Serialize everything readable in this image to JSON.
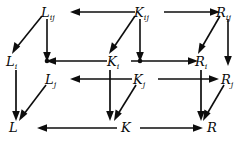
{
  "diagram": {
    "type": "commutative-diagram",
    "width": 248,
    "height": 143,
    "background_color": "#ffffff",
    "ink_color": "#0d0d0d",
    "nodes": [
      {
        "id": "Lij",
        "base": "L",
        "sub": "ij",
        "x": 47,
        "y": 14,
        "row": "top",
        "column": "L"
      },
      {
        "id": "Kij",
        "base": "K",
        "sub": "ij",
        "x": 140,
        "y": 14,
        "row": "top",
        "column": "K"
      },
      {
        "id": "Rij",
        "base": "R",
        "sub": "ij",
        "x": 222,
        "y": 14,
        "row": "top",
        "column": "R"
      },
      {
        "id": "Li",
        "base": "L",
        "sub": "i",
        "x": 11,
        "y": 63,
        "row": "middle",
        "column": "L"
      },
      {
        "id": "Ki",
        "base": "K",
        "sub": "i",
        "x": 113,
        "y": 63,
        "row": "middle",
        "column": "K"
      },
      {
        "id": "Ri",
        "base": "R",
        "sub": "i",
        "x": 200,
        "y": 63,
        "row": "middle",
        "column": "R"
      },
      {
        "id": "Lj",
        "base": "L",
        "sub": "j",
        "x": 50,
        "y": 81,
        "row": "inner",
        "column": "L"
      },
      {
        "id": "Kj",
        "base": "K",
        "sub": "j",
        "x": 139,
        "y": 81,
        "row": "inner",
        "column": "K"
      },
      {
        "id": "Rj",
        "base": "R",
        "sub": "j",
        "x": 226,
        "y": 81,
        "row": "inner",
        "column": "R"
      },
      {
        "id": "L",
        "base": "L",
        "sub": "",
        "x": 14,
        "y": 129,
        "row": "bottom",
        "column": "L"
      },
      {
        "id": "K",
        "base": "K",
        "sub": "",
        "x": 126,
        "y": 129,
        "row": "bottom",
        "column": "K"
      },
      {
        "id": "R",
        "base": "R",
        "sub": "",
        "x": 212,
        "y": 129,
        "row": "bottom",
        "column": "R"
      }
    ],
    "edges": [
      {
        "id": "Kij-to-Lij",
        "from": "Kij",
        "to": "Lij",
        "direction": "left",
        "style": "horizontal"
      },
      {
        "id": "Kij-to-Rij",
        "from": "Kij",
        "to": "Rij",
        "direction": "right",
        "style": "horizontal"
      },
      {
        "id": "Lij-to-Li",
        "from": "Lij",
        "to": "Li",
        "direction": "down-left",
        "style": "diagonal"
      },
      {
        "id": "Kij-to-Ki",
        "from": "Kij",
        "to": "Ki",
        "direction": "down-left",
        "style": "diagonal"
      },
      {
        "id": "Rij-to-Ri",
        "from": "Rij",
        "to": "Ri",
        "direction": "down-left",
        "style": "diagonal"
      },
      {
        "id": "Lij-to-Lj",
        "from": "Lij",
        "to": "Lj",
        "direction": "down",
        "style": "vertical"
      },
      {
        "id": "Kij-to-Kj",
        "from": "Kij",
        "to": "Kj",
        "direction": "down",
        "style": "vertical"
      },
      {
        "id": "Rij-to-Rj",
        "from": "Rij",
        "to": "Rj",
        "direction": "down",
        "style": "vertical"
      },
      {
        "id": "Ki-to-Li",
        "from": "Ki",
        "to": "Li",
        "direction": "left",
        "style": "horizontal"
      },
      {
        "id": "Ki-to-Ri",
        "from": "Ki",
        "to": "Ri",
        "direction": "right",
        "style": "horizontal"
      },
      {
        "id": "Kj-to-Lj",
        "from": "Kj",
        "to": "Lj",
        "direction": "left",
        "style": "horizontal"
      },
      {
        "id": "Kj-to-Rj",
        "from": "Kj",
        "to": "Rj",
        "direction": "right",
        "style": "horizontal"
      },
      {
        "id": "Li-to-L",
        "from": "Li",
        "to": "L",
        "direction": "down",
        "style": "vertical"
      },
      {
        "id": "Ki-to-K",
        "from": "Ki",
        "to": "K",
        "direction": "down",
        "style": "vertical"
      },
      {
        "id": "Ri-to-R",
        "from": "Ri",
        "to": "R",
        "direction": "down",
        "style": "vertical"
      },
      {
        "id": "Lj-to-L",
        "from": "Lj",
        "to": "L",
        "direction": "down-left",
        "style": "diagonal"
      },
      {
        "id": "Kj-to-K",
        "from": "Kj",
        "to": "K",
        "direction": "down-left",
        "style": "diagonal"
      },
      {
        "id": "Rj-to-R",
        "from": "Rj",
        "to": "R",
        "direction": "down-left",
        "style": "diagonal"
      },
      {
        "id": "K-to-L",
        "from": "K",
        "to": "L",
        "direction": "left",
        "style": "horizontal"
      },
      {
        "id": "K-to-R",
        "from": "K",
        "to": "R",
        "direction": "right",
        "style": "horizontal"
      }
    ]
  }
}
